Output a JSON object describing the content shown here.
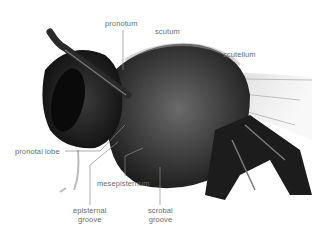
{
  "diagram": {
    "labels": {
      "pronotum": "pronotum",
      "scutum": "scutum",
      "scutellum": "scutellum",
      "pronotal_lobe": "pronotal lobe",
      "mesepisternum": "mesepisternum",
      "episternal_groove_1": "episternal",
      "episternal_groove_2": "groove",
      "scrobal_groove_1": "scrobal",
      "scrobal_groove_2": "groove"
    },
    "colors": {
      "background": "#ffffff",
      "label_text": "#6b6b6b",
      "leader_line": "#8a8a8a",
      "specimen_dark": "#1a1a1a",
      "specimen_mid": "#5a5a5a",
      "wing": "#d8d8d8"
    }
  }
}
